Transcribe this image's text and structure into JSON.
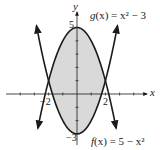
{
  "chart_data": {
    "type": "line",
    "title": "",
    "xlabel": "x",
    "ylabel": "y",
    "xlim": [
      -5,
      5
    ],
    "ylim": [
      -4,
      6.5
    ],
    "grid": false,
    "series": [
      {
        "name": "f(x) = 5 - x^2",
        "label": "f(x) = 5 − x²",
        "formula": "5 - x^2",
        "x": [
          -3,
          -2.5,
          -2,
          -1,
          0,
          1,
          2,
          2.5,
          3
        ],
        "values": [
          -4,
          -1.25,
          1,
          4,
          5,
          4,
          1,
          -1.25,
          -4
        ]
      },
      {
        "name": "g(x) = x^2 - 3",
        "label": "g(x) = x² − 3",
        "formula": "x^2 - 3",
        "x": [
          -3,
          -2.5,
          -2,
          -1,
          0,
          1,
          2,
          2.5,
          3
        ],
        "values": [
          6,
          3.25,
          1,
          -2,
          -3,
          -2,
          1,
          3.25,
          6
        ]
      }
    ],
    "shaded_region": {
      "between": [
        "f(x)",
        "g(x)"
      ],
      "x_range": [
        -2,
        2
      ],
      "fill": "#d9d9d9"
    },
    "tick_labels": {
      "x": [
        "-2",
        "2"
      ],
      "y": [
        "5",
        "-3"
      ]
    },
    "intersections": [
      [
        -2,
        1
      ],
      [
        2,
        1
      ]
    ],
    "annotations": [
      {
        "text": "g(x) = x² − 3",
        "position": "top-right"
      },
      {
        "text": "f(x) = 5 − x²",
        "position": "bottom-right"
      }
    ]
  },
  "labels": {
    "x_axis": "x",
    "y_axis": "y",
    "tick_x_neg2": "−2",
    "tick_x_2": "2",
    "tick_y_5": "5",
    "tick_y_neg3": "−3",
    "g_label_name": "g",
    "g_label_rest": "(x) = x² − 3",
    "f_label_name": "f",
    "f_label_rest": "(x) = 5 − x²"
  },
  "colors": {
    "stroke": "#1a1a1a",
    "fill": "#d9d9d9"
  }
}
